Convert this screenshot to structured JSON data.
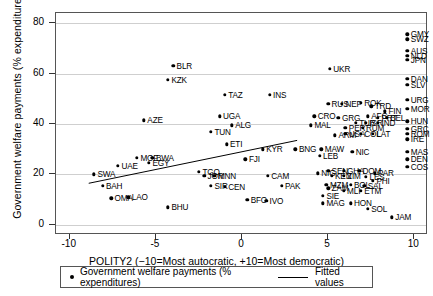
{
  "chart_data": {
    "type": "scatter",
    "title": "",
    "xlabel": "POLITY2 (−10=Most autocratic, +10=Most democratic)",
    "ylabel": "Government welfare payments (% expenditures)",
    "xlim": [
      -10.8,
      10.8
    ],
    "ylim": [
      -4,
      84
    ],
    "xticks": [
      "-10",
      "-5",
      "0",
      "5",
      "10"
    ],
    "xtick_values": [
      -10,
      -5,
      0,
      5,
      10
    ],
    "yticks": [
      "0",
      "20",
      "40",
      "60",
      "80"
    ],
    "ytick_values": [
      0,
      20,
      40,
      60,
      80
    ],
    "grid": "horizontal",
    "legend_position": "below-axes",
    "series": [
      {
        "name": "Government welfare payments (% expenditures)",
        "marker": "filled-circle",
        "color": "#000000",
        "points": [
          {
            "label": "BLR",
            "x": -4.0,
            "y": 63.0
          },
          {
            "label": "KZK",
            "x": -4.3,
            "y": 57.5
          },
          {
            "label": "TAZ",
            "x": -1.0,
            "y": 51.5
          },
          {
            "label": "INS",
            "x": 1.6,
            "y": 51.5
          },
          {
            "label": "UKR",
            "x": 5.1,
            "y": 62.0
          },
          {
            "label": "AZE",
            "x": -5.7,
            "y": 41.5
          },
          {
            "label": "UGA",
            "x": -1.3,
            "y": 43.0
          },
          {
            "label": "ALG",
            "x": -0.6,
            "y": 39.5
          },
          {
            "label": "TUN",
            "x": -1.8,
            "y": 37.0
          },
          {
            "label": "ETI",
            "x": -0.9,
            "y": 32.0
          },
          {
            "label": "CRO",
            "x": 4.2,
            "y": 43.0
          },
          {
            "label": "MAL",
            "x": 4.0,
            "y": 39.5
          },
          {
            "label": "GRG",
            "x": 5.6,
            "y": 42.5
          },
          {
            "label": "RUS",
            "x": 5.0,
            "y": 48.0
          },
          {
            "label": "NEP",
            "x": 5.8,
            "y": 48.0
          },
          {
            "label": "ROK",
            "x": 6.9,
            "y": 48.5
          },
          {
            "label": "TRD",
            "x": 7.5,
            "y": 47.0
          },
          {
            "label": "FIN",
            "x": 8.3,
            "y": 45.0
          },
          {
            "label": "PER",
            "x": 6.0,
            "y": 38.5
          },
          {
            "label": "RUM",
            "x": 7.0,
            "y": 38.5
          },
          {
            "label": "TUR",
            "x": 6.6,
            "y": 40.5
          },
          {
            "label": "ISR",
            "x": 7.2,
            "y": 40.5
          },
          {
            "label": "IND",
            "x": 7.9,
            "y": 40.5
          },
          {
            "label": "ARM",
            "x": 5.4,
            "y": 35.5
          },
          {
            "label": "USA",
            "x": 6.0,
            "y": 36.0
          },
          {
            "label": "COL",
            "x": 6.9,
            "y": 36.0
          },
          {
            "label": "LAT",
            "x": 7.6,
            "y": 36.0
          },
          {
            "label": "AFG",
            "x": 7.3,
            "y": 43.0
          },
          {
            "label": "PRT",
            "x": 7.9,
            "y": 42.5
          },
          {
            "label": "BEL",
            "x": 8.4,
            "y": 42.5
          },
          {
            "label": "GMY",
            "x": 9.6,
            "y": 75.5
          },
          {
            "label": "SWZ",
            "x": 9.6,
            "y": 73.5
          },
          {
            "label": "AUS",
            "x": 9.6,
            "y": 69.0
          },
          {
            "label": "NLD",
            "x": 9.6,
            "y": 67.0
          },
          {
            "label": "JPN",
            "x": 9.6,
            "y": 65.5
          },
          {
            "label": "DAN",
            "x": 9.6,
            "y": 58.0
          },
          {
            "label": "SLV",
            "x": 9.6,
            "y": 55.5
          },
          {
            "label": "URG",
            "x": 9.6,
            "y": 49.5
          },
          {
            "label": "MOR",
            "x": 9.6,
            "y": 46.0
          },
          {
            "label": "HUN",
            "x": 9.6,
            "y": 41.0
          },
          {
            "label": "GRC",
            "x": 9.6,
            "y": 38.0
          },
          {
            "label": "ROM",
            "x": 9.6,
            "y": 36.0
          },
          {
            "label": "IRE",
            "x": 9.6,
            "y": 34.0
          },
          {
            "label": "MAS",
            "x": 9.6,
            "y": 29.0
          },
          {
            "label": "DEN",
            "x": 9.6,
            "y": 26.0
          },
          {
            "label": "COS",
            "x": 9.6,
            "y": 23.0
          },
          {
            "label": "MOF",
            "x": -6.1,
            "y": 26.5
          },
          {
            "label": "BWA",
            "x": -5.2,
            "y": 26.5
          },
          {
            "label": "EGY",
            "x": -5.4,
            "y": 24.5
          },
          {
            "label": "UAE",
            "x": -7.2,
            "y": 23.5
          },
          {
            "label": "SWA",
            "x": -8.6,
            "y": 20.0
          },
          {
            "label": "BAH",
            "x": -8.1,
            "y": 15.5
          },
          {
            "label": "OMA",
            "x": -7.6,
            "y": 10.5
          },
          {
            "label": "LAO",
            "x": -6.6,
            "y": 11.0
          },
          {
            "label": "BHU",
            "x": -4.3,
            "y": 7.0
          },
          {
            "label": "TGO",
            "x": -2.5,
            "y": 21.0
          },
          {
            "label": "JOR",
            "x": -2.2,
            "y": 19.5
          },
          {
            "label": "MNN",
            "x": -1.6,
            "y": 19.5
          },
          {
            "label": "SIR",
            "x": -1.8,
            "y": 15.5
          },
          {
            "label": "CEN",
            "x": -1.0,
            "y": 15.0
          },
          {
            "label": "KYR",
            "x": 1.2,
            "y": 30.0
          },
          {
            "label": "FJI",
            "x": 0.2,
            "y": 26.0
          },
          {
            "label": "CAM",
            "x": 1.5,
            "y": 19.5
          },
          {
            "label": "PAK",
            "x": 2.3,
            "y": 15.5
          },
          {
            "label": "BFO",
            "x": 0.3,
            "y": 10.0
          },
          {
            "label": "IVO",
            "x": 1.4,
            "y": 9.5
          },
          {
            "label": "BNG",
            "x": 3.1,
            "y": 30.0
          },
          {
            "label": "MAW",
            "x": 4.6,
            "y": 30.0
          },
          {
            "label": "LEB",
            "x": 4.5,
            "y": 27.5
          },
          {
            "label": "NIC",
            "x": 6.4,
            "y": 29.0
          },
          {
            "label": "NIG",
            "x": 4.4,
            "y": 20.5
          },
          {
            "label": "SEN",
            "x": 5.0,
            "y": 21.5
          },
          {
            "label": "GHA",
            "x": 5.9,
            "y": 21.5
          },
          {
            "label": "DOM",
            "x": 6.8,
            "y": 21.5
          },
          {
            "label": "PAR",
            "x": 7.7,
            "y": 20.5
          },
          {
            "label": "KEN",
            "x": 5.2,
            "y": 19.5
          },
          {
            "label": "ZIM",
            "x": 5.9,
            "y": 19.5
          },
          {
            "label": "LES",
            "x": 7.2,
            "y": 19.0
          },
          {
            "label": "PHI",
            "x": 7.6,
            "y": 17.5
          },
          {
            "label": "MZM",
            "x": 4.9,
            "y": 16.0
          },
          {
            "label": "BOL",
            "x": 6.3,
            "y": 16.0
          },
          {
            "label": "SAL",
            "x": 7.1,
            "y": 15.5
          },
          {
            "label": "ZAM",
            "x": 5.0,
            "y": 14.5
          },
          {
            "label": "MLI",
            "x": 5.9,
            "y": 13.5
          },
          {
            "label": "ETM",
            "x": 6.9,
            "y": 13.5
          },
          {
            "label": "SIE",
            "x": 4.7,
            "y": 11.5
          },
          {
            "label": "MAG",
            "x": 4.7,
            "y": 8.5
          },
          {
            "label": "HON",
            "x": 6.3,
            "y": 8.5
          },
          {
            "label": "SOL",
            "x": 7.3,
            "y": 6.5
          },
          {
            "label": "JAM",
            "x": 8.7,
            "y": 3.0
          }
        ]
      }
    ],
    "fit": {
      "name": "Fitted values",
      "color": "#000000",
      "x0": -8.9,
      "y0": 16.5,
      "x1": 3.2,
      "y1": 33.5
    }
  },
  "legend": {
    "scatter_label": "Government welfare payments (% expenditures)",
    "fit_label": "Fitted values"
  }
}
